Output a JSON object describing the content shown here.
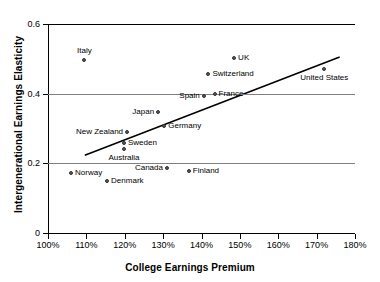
{
  "chart_data": {
    "type": "scatter",
    "title": "",
    "xlabel": "College Earnings Premium",
    "ylabel": "Intergenerational Earnings Elasticity",
    "xlim": [
      100,
      180
    ],
    "ylim": [
      0,
      0.6
    ],
    "xticks": [
      "100%",
      "110%",
      "120%",
      "130%",
      "140%",
      "150%",
      "160%",
      "170%",
      "180%"
    ],
    "xtick_values": [
      100,
      110,
      120,
      130,
      140,
      150,
      160,
      170,
      180
    ],
    "yticks": [
      "0",
      "0.2",
      "0.4",
      "0.6"
    ],
    "ytick_values": [
      0,
      0.2,
      0.4,
      0.6
    ],
    "grid": "horizontal",
    "legend": "none",
    "marker_color": "#595959",
    "trendline_color": "#000000",
    "gridline_color": "#808080",
    "points": [
      {
        "label": "Italy",
        "x": 109.5,
        "y": 0.497,
        "label_pos": "above"
      },
      {
        "label": "UK",
        "x": 148.5,
        "y": 0.502,
        "label_pos": "right"
      },
      {
        "label": "United States",
        "x": 172.0,
        "y": 0.47,
        "label_pos": "below"
      },
      {
        "label": "Switzerland",
        "x": 141.8,
        "y": 0.457,
        "label_pos": "right"
      },
      {
        "label": "France",
        "x": 143.4,
        "y": 0.398,
        "label_pos": "right"
      },
      {
        "label": "Spain",
        "x": 140.6,
        "y": 0.393,
        "label_pos": "left"
      },
      {
        "label": "Japan",
        "x": 128.7,
        "y": 0.347,
        "label_pos": "left"
      },
      {
        "label": "Germany",
        "x": 130.3,
        "y": 0.306,
        "label_pos": "right"
      },
      {
        "label": "New Zealand",
        "x": 120.6,
        "y": 0.289,
        "label_pos": "left"
      },
      {
        "label": "Sweden",
        "x": 119.8,
        "y": 0.259,
        "label_pos": "right"
      },
      {
        "label": "Australia",
        "x": 119.8,
        "y": 0.24,
        "label_pos": "below"
      },
      {
        "label": "Canada",
        "x": 131.0,
        "y": 0.187,
        "label_pos": "left"
      },
      {
        "label": "Finland",
        "x": 136.7,
        "y": 0.178,
        "label_pos": "right"
      },
      {
        "label": "Norway",
        "x": 106.0,
        "y": 0.172,
        "label_pos": "right"
      },
      {
        "label": "Denmark",
        "x": 115.4,
        "y": 0.149,
        "label_pos": "right"
      }
    ],
    "trendline": {
      "x0": 109.6,
      "y0": 0.223,
      "x1": 176.0,
      "y1": 0.505
    }
  }
}
